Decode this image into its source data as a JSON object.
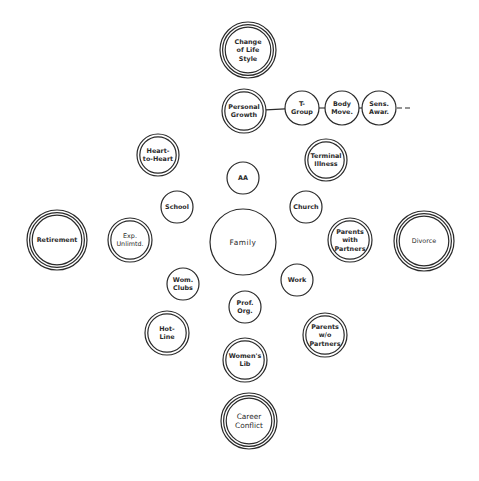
{
  "diagram": {
    "type": "radial-node-diagram",
    "center_node": "Family",
    "nodes": [
      {
        "id": "change-of-life-style",
        "lines": [
          "Change",
          "of Life",
          "Style"
        ],
        "x": 248,
        "y": 50,
        "r": 28,
        "rings": 3
      },
      {
        "id": "personal-growth",
        "lines": [
          "Personal",
          "Growth"
        ],
        "x": 244,
        "y": 111,
        "r": 22,
        "rings": 2
      },
      {
        "id": "t-group",
        "lines": [
          "T-",
          "Group"
        ],
        "x": 302,
        "y": 108,
        "r": 17,
        "rings": 1
      },
      {
        "id": "body-move",
        "lines": [
          "Body",
          "Move."
        ],
        "x": 342,
        "y": 108,
        "r": 17,
        "rings": 1
      },
      {
        "id": "sens-awar",
        "lines": [
          "Sens.",
          "Awar."
        ],
        "x": 379,
        "y": 108,
        "r": 17,
        "rings": 1
      },
      {
        "id": "heart-to-heart",
        "lines": [
          "Heart-",
          "to-Heart"
        ],
        "x": 158,
        "y": 155,
        "r": 21,
        "rings": 2
      },
      {
        "id": "terminal-illness",
        "lines": [
          "Terminal",
          "Illness"
        ],
        "x": 326,
        "y": 160,
        "r": 21,
        "rings": 2
      },
      {
        "id": "aa",
        "lines": [
          "AA"
        ],
        "x": 243,
        "y": 178,
        "r": 16,
        "rings": 1
      },
      {
        "id": "school",
        "lines": [
          "School"
        ],
        "x": 177,
        "y": 207,
        "r": 16,
        "rings": 1
      },
      {
        "id": "church",
        "lines": [
          "Church"
        ],
        "x": 306,
        "y": 207,
        "r": 16,
        "rings": 1
      },
      {
        "id": "retirement",
        "lines": [
          "Retirement"
        ],
        "x": 57,
        "y": 240,
        "r": 30,
        "rings": 3
      },
      {
        "id": "exp-unlimtd",
        "lines": [
          "Exp.",
          "Unlimtd."
        ],
        "x": 130,
        "y": 240,
        "r": 22,
        "rings": 2
      },
      {
        "id": "family",
        "lines": [
          "Family"
        ],
        "x": 243,
        "y": 242,
        "r": 33,
        "rings": 1
      },
      {
        "id": "parents-with-partners",
        "lines": [
          "Parents",
          "with",
          "Partners"
        ],
        "x": 350,
        "y": 240,
        "r": 22,
        "rings": 2
      },
      {
        "id": "divorce",
        "lines": [
          "Divorce"
        ],
        "x": 424,
        "y": 241,
        "r": 30,
        "rings": 3
      },
      {
        "id": "wom-clubs",
        "lines": [
          "Wom.",
          "Clubs"
        ],
        "x": 183,
        "y": 284,
        "r": 16,
        "rings": 1
      },
      {
        "id": "work",
        "lines": [
          "Work"
        ],
        "x": 297,
        "y": 280,
        "r": 16,
        "rings": 1
      },
      {
        "id": "prof-org",
        "lines": [
          "Prof.",
          "Org."
        ],
        "x": 245,
        "y": 307,
        "r": 16,
        "rings": 1
      },
      {
        "id": "hot-line",
        "lines": [
          "Hot-",
          "Line"
        ],
        "x": 167,
        "y": 333,
        "r": 22,
        "rings": 2
      },
      {
        "id": "parents-wo-partners",
        "lines": [
          "Parents",
          "w/o",
          "Partners"
        ],
        "x": 325,
        "y": 335,
        "r": 22,
        "rings": 2
      },
      {
        "id": "womens-lib",
        "lines": [
          "Women's",
          "Lib"
        ],
        "x": 245,
        "y": 360,
        "r": 22,
        "rings": 2
      },
      {
        "id": "career-conflict",
        "lines": [
          "Career",
          "Conflict"
        ],
        "x": 249,
        "y": 421,
        "r": 28,
        "rings": 3
      }
    ],
    "connections": [
      {
        "from": "personal-growth",
        "to": "t-group"
      },
      {
        "from": "t-group",
        "to": "body-move"
      },
      {
        "from": "body-move",
        "to": "sens-awar"
      }
    ],
    "continuation": {
      "from": "sens-awar",
      "style": "dashed",
      "x1": 397,
      "x2": 412,
      "y": 108
    },
    "colors": {
      "stroke": "#2a2a2a",
      "background": "#ffffff",
      "text": "#2a2a2a"
    }
  }
}
